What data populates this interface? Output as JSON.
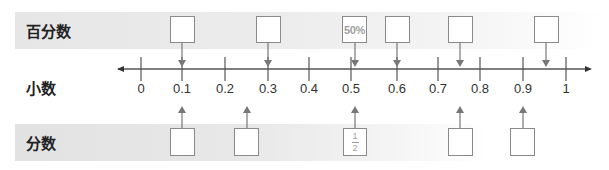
{
  "rows": {
    "percent_label": "百分数",
    "decimal_label": "小数",
    "fraction_label": "分数"
  },
  "number_line": {
    "ticks": [
      "0",
      "0.1",
      "0.2",
      "0.3",
      "0.4",
      "0.5",
      "0.6",
      "0.7",
      "0.8",
      "0.9",
      "1"
    ],
    "line_color": "#555555"
  },
  "percent_boxes": [
    {
      "position": 0.1,
      "value": ""
    },
    {
      "position": 0.3,
      "value": ""
    },
    {
      "position": 0.5,
      "value": "50%"
    },
    {
      "position": 0.6,
      "value": ""
    },
    {
      "position": 0.75,
      "value": ""
    },
    {
      "position": 0.95,
      "value": ""
    }
  ],
  "fraction_boxes": [
    {
      "position": 0.1,
      "value": ""
    },
    {
      "position": 0.25,
      "value": ""
    },
    {
      "position": 0.5,
      "numerator": "1",
      "denominator": "2"
    },
    {
      "position": 0.75,
      "value": ""
    },
    {
      "position": 0.9,
      "value": ""
    }
  ]
}
